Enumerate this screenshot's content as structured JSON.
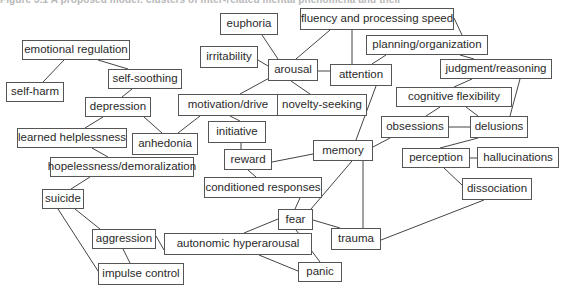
{
  "figure": {
    "caption": "Figure 3.1 A proposed model: clusters of inter-related mental phenomena and their"
  },
  "colors": {
    "background": "#ffffff",
    "box_border": "#555555",
    "text": "#2a2a2a",
    "edge": "#444444"
  },
  "nodes": [
    {
      "id": "euphoria",
      "label": "euphoria",
      "x": 220,
      "y": 13,
      "w": 58,
      "h": 22
    },
    {
      "id": "fluency",
      "label": "fluency and processing speed",
      "x": 300,
      "y": 8,
      "w": 154,
      "h": 22
    },
    {
      "id": "emoreg",
      "label": "emotional regulation",
      "x": 22,
      "y": 40,
      "w": 108,
      "h": 20
    },
    {
      "id": "irritability",
      "label": "irritability",
      "x": 200,
      "y": 46,
      "w": 58,
      "h": 22
    },
    {
      "id": "arousal",
      "label": "arousal",
      "x": 268,
      "y": 59,
      "w": 50,
      "h": 22
    },
    {
      "id": "attention",
      "label": "attention",
      "x": 330,
      "y": 64,
      "w": 62,
      "h": 22
    },
    {
      "id": "planning",
      "label": "planning/organization",
      "x": 366,
      "y": 35,
      "w": 122,
      "h": 20
    },
    {
      "id": "judgment",
      "label": "judgment/reasoning",
      "x": 440,
      "y": 59,
      "w": 112,
      "h": 20
    },
    {
      "id": "selfsoothing",
      "label": "self-soothing",
      "x": 108,
      "y": 69,
      "w": 74,
      "h": 20
    },
    {
      "id": "selfharm",
      "label": "self-harm",
      "x": 6,
      "y": 82,
      "w": 58,
      "h": 20
    },
    {
      "id": "depression",
      "label": "depression",
      "x": 85,
      "y": 97,
      "w": 66,
      "h": 20
    },
    {
      "id": "motivation",
      "label": "motivation/drive",
      "x": 178,
      "y": 94,
      "w": 100,
      "h": 22
    },
    {
      "id": "novelty",
      "label": "novelty-seeking",
      "x": 277,
      "y": 94,
      "w": 90,
      "h": 22
    },
    {
      "id": "cogflex",
      "label": "cognitive flexibility",
      "x": 396,
      "y": 87,
      "w": 116,
      "h": 20
    },
    {
      "id": "learned",
      "label": "learned helplessness",
      "x": 17,
      "y": 128,
      "w": 110,
      "h": 20
    },
    {
      "id": "anhedonia",
      "label": "anhedonia",
      "x": 132,
      "y": 133,
      "w": 66,
      "h": 22
    },
    {
      "id": "initiative",
      "label": "initiative",
      "x": 208,
      "y": 121,
      "w": 58,
      "h": 22
    },
    {
      "id": "obsessions",
      "label": "obsessions",
      "x": 381,
      "y": 116,
      "w": 68,
      "h": 22
    },
    {
      "id": "delusions",
      "label": "delusions",
      "x": 470,
      "y": 116,
      "w": 58,
      "h": 22
    },
    {
      "id": "memory",
      "label": "memory",
      "x": 313,
      "y": 140,
      "w": 60,
      "h": 21
    },
    {
      "id": "reward",
      "label": "reward",
      "x": 224,
      "y": 149,
      "w": 48,
      "h": 21
    },
    {
      "id": "perception",
      "label": "perception",
      "x": 402,
      "y": 148,
      "w": 68,
      "h": 20
    },
    {
      "id": "hallucinations",
      "label": "hallucinations",
      "x": 477,
      "y": 147,
      "w": 82,
      "h": 21
    },
    {
      "id": "hopeless",
      "label": "hopelessness/demoralization",
      "x": 50,
      "y": 157,
      "w": 144,
      "h": 20
    },
    {
      "id": "conditioned",
      "label": "conditioned responses",
      "x": 204,
      "y": 177,
      "w": 118,
      "h": 21
    },
    {
      "id": "dissociation",
      "label": "dissociation",
      "x": 462,
      "y": 178,
      "w": 70,
      "h": 22
    },
    {
      "id": "suicide",
      "label": "suicide",
      "x": 42,
      "y": 189,
      "w": 42,
      "h": 20
    },
    {
      "id": "fear",
      "label": "fear",
      "x": 278,
      "y": 209,
      "w": 35,
      "h": 21
    },
    {
      "id": "trauma",
      "label": "trauma",
      "x": 331,
      "y": 228,
      "w": 50,
      "h": 22
    },
    {
      "id": "aggression",
      "label": "aggression",
      "x": 92,
      "y": 229,
      "w": 64,
      "h": 20
    },
    {
      "id": "autonomic",
      "label": "autonomic hyperarousal",
      "x": 164,
      "y": 233,
      "w": 148,
      "h": 22
    },
    {
      "id": "impulse",
      "label": "impulse control",
      "x": 98,
      "y": 263,
      "w": 86,
      "h": 22
    },
    {
      "id": "panic",
      "label": "panic",
      "x": 298,
      "y": 262,
      "w": 44,
      "h": 20
    }
  ],
  "edges": [
    {
      "from": "emoreg",
      "to": "selfharm",
      "x1": 64,
      "y1": 60,
      "x2": 43,
      "y2": 82
    },
    {
      "from": "emoreg",
      "to": "selfsoothing",
      "x1": 98,
      "y1": 60,
      "x2": 128,
      "y2": 69
    },
    {
      "from": "selfsoothing",
      "to": "depression",
      "x1": 132,
      "y1": 89,
      "x2": 122,
      "y2": 97
    },
    {
      "from": "depression",
      "to": "learned",
      "x1": 103,
      "y1": 117,
      "x2": 85,
      "y2": 128
    },
    {
      "from": "depression",
      "to": "anhedonia",
      "x1": 144,
      "y1": 117,
      "x2": 162,
      "y2": 133
    },
    {
      "from": "anhedonia",
      "to": "motivation",
      "x1": 178,
      "y1": 133,
      "x2": 200,
      "y2": 116
    },
    {
      "from": "learned",
      "to": "hopeless",
      "x1": 92,
      "y1": 148,
      "x2": 108,
      "y2": 157
    },
    {
      "from": "hopeless",
      "to": "suicide",
      "x1": 90,
      "y1": 177,
      "x2": 71,
      "y2": 189
    },
    {
      "from": "suicide",
      "to": "aggression",
      "x1": 75,
      "y1": 209,
      "x2": 100,
      "y2": 229
    },
    {
      "from": "suicide",
      "to": "impulse",
      "x1": 58,
      "y1": 209,
      "x2": 100,
      "y2": 274
    },
    {
      "from": "aggression",
      "to": "impulse",
      "x1": 123,
      "y1": 249,
      "x2": 130,
      "y2": 263
    },
    {
      "from": "aggression",
      "to": "autonomic",
      "x1": 156,
      "y1": 236,
      "x2": 164,
      "y2": 250
    },
    {
      "from": "autonomic",
      "to": "fear",
      "x1": 244,
      "y1": 233,
      "x2": 278,
      "y2": 219
    },
    {
      "from": "autonomic",
      "to": "panic",
      "x1": 259,
      "y1": 255,
      "x2": 298,
      "y2": 271
    },
    {
      "from": "fear",
      "to": "panic",
      "x1": 296,
      "y1": 230,
      "x2": 320,
      "y2": 262
    },
    {
      "from": "fear",
      "to": "trauma",
      "x1": 313,
      "y1": 220,
      "x2": 340,
      "y2": 228
    },
    {
      "from": "fear",
      "to": "conditioned",
      "x1": 295,
      "y1": 209,
      "x2": 300,
      "y2": 198
    },
    {
      "from": "fear",
      "to": "memory",
      "x1": 311,
      "y1": 209,
      "x2": 352,
      "y2": 161
    },
    {
      "from": "trauma",
      "to": "memory",
      "x1": 363,
      "y1": 228,
      "x2": 363,
      "y2": 161
    },
    {
      "from": "trauma",
      "to": "dissociation",
      "x1": 381,
      "y1": 240,
      "x2": 484,
      "y2": 200
    },
    {
      "from": "conditioned",
      "to": "reward",
      "x1": 256,
      "y1": 177,
      "x2": 248,
      "y2": 170
    },
    {
      "from": "reward",
      "to": "memory",
      "x1": 272,
      "y1": 162,
      "x2": 313,
      "y2": 154
    },
    {
      "from": "reward",
      "to": "initiative",
      "x1": 241,
      "y1": 149,
      "x2": 241,
      "y2": 143
    },
    {
      "from": "initiative",
      "to": "motivation",
      "x1": 240,
      "y1": 121,
      "x2": 230,
      "y2": 116
    },
    {
      "from": "motivation",
      "to": "novelty",
      "x1": 278,
      "y1": 105,
      "x2": 277,
      "y2": 105
    },
    {
      "from": "motivation",
      "to": "arousal",
      "x1": 240,
      "y1": 94,
      "x2": 273,
      "y2": 76
    },
    {
      "from": "arousal",
      "to": "novelty",
      "x1": 291,
      "y1": 81,
      "x2": 310,
      "y2": 94
    },
    {
      "from": "arousal",
      "to": "irritability",
      "x1": 258,
      "y1": 60,
      "x2": 268,
      "y2": 66
    },
    {
      "from": "arousal",
      "to": "euphoria",
      "x1": 278,
      "y1": 59,
      "x2": 262,
      "y2": 35
    },
    {
      "from": "arousal",
      "to": "fluency",
      "x1": 296,
      "y1": 59,
      "x2": 330,
      "y2": 30
    },
    {
      "from": "arousal",
      "to": "attention",
      "x1": 318,
      "y1": 71,
      "x2": 330,
      "y2": 71
    },
    {
      "from": "attention",
      "to": "fluency",
      "x1": 352,
      "y1": 64,
      "x2": 352,
      "y2": 30
    },
    {
      "from": "attention",
      "to": "planning",
      "x1": 372,
      "y1": 64,
      "x2": 386,
      "y2": 55
    },
    {
      "from": "attention",
      "to": "memory",
      "x1": 376,
      "y1": 86,
      "x2": 356,
      "y2": 140
    },
    {
      "from": "fluency",
      "to": "planning",
      "x1": 454,
      "y1": 18,
      "x2": 462,
      "y2": 35
    },
    {
      "from": "planning",
      "to": "judgment",
      "x1": 460,
      "y1": 55,
      "x2": 474,
      "y2": 59
    },
    {
      "from": "judgment",
      "to": "cogflex",
      "x1": 472,
      "y1": 79,
      "x2": 454,
      "y2": 87
    },
    {
      "from": "judgment",
      "to": "delusions",
      "x1": 520,
      "y1": 79,
      "x2": 510,
      "y2": 116
    },
    {
      "from": "cogflex",
      "to": "obsessions",
      "x1": 440,
      "y1": 107,
      "x2": 426,
      "y2": 116
    },
    {
      "from": "cogflex",
      "to": "delusions",
      "x1": 466,
      "y1": 107,
      "x2": 478,
      "y2": 116
    },
    {
      "from": "obsessions",
      "to": "delusions",
      "x1": 449,
      "y1": 127,
      "x2": 470,
      "y2": 127
    },
    {
      "from": "obsessions",
      "to": "memory",
      "x1": 390,
      "y1": 138,
      "x2": 373,
      "y2": 147
    },
    {
      "from": "delusions",
      "to": "perception",
      "x1": 478,
      "y1": 138,
      "x2": 440,
      "y2": 148
    },
    {
      "from": "perception",
      "to": "hallucinations",
      "x1": 470,
      "y1": 158,
      "x2": 477,
      "y2": 158
    },
    {
      "from": "perception",
      "to": "dissociation",
      "x1": 444,
      "y1": 168,
      "x2": 462,
      "y2": 185
    }
  ]
}
